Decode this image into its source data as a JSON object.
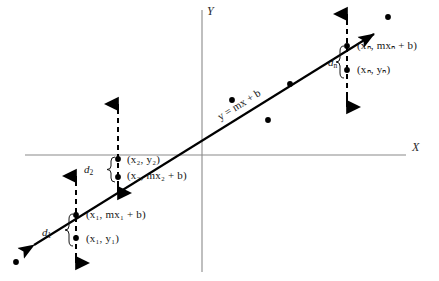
{
  "figure": {
    "axes": {
      "x_label": "X",
      "y_label": "Y",
      "x_axis_y": 155,
      "y_axis_x": 202,
      "color": "#8a8a8a"
    },
    "line": {
      "equation_label": "y = mx + b",
      "color": "#000000",
      "start": [
        30,
        248
      ],
      "end": [
        378,
        31
      ]
    },
    "deviations": [
      {
        "name": "d1",
        "label": "d",
        "subscript": "1",
        "x": 76,
        "line_point_y": 215,
        "data_point_y": 238,
        "arrow_top_y": 175,
        "arrow_bottom_y": 263,
        "labels": [
          {
            "text": "(x₁, mx₁ + b)",
            "plain": "(x1, mx1 + b)",
            "position": "above"
          },
          {
            "text": "(x₁, y₁)",
            "plain": "(x1, y1)",
            "position": "below"
          }
        ]
      },
      {
        "name": "d2",
        "label": "d",
        "subscript": "2",
        "x": 118,
        "line_point_y": 177,
        "data_point_y": 159,
        "arrow_top_y": 103,
        "arrow_bottom_y": 192,
        "labels": [
          {
            "text": "(x₂, y₂)",
            "plain": "(x2, y2)",
            "position": "above"
          },
          {
            "text": "(x₂, mx₂ + b)",
            "plain": "(x2, mx2 + b)",
            "position": "below"
          }
        ]
      },
      {
        "name": "dn",
        "label": "d",
        "subscript": "n",
        "x": 347,
        "line_point_y": 46,
        "data_point_y": 70,
        "arrow_top_y": 14,
        "arrow_bottom_y": 106,
        "labels": [
          {
            "text": "(xₙ, mxₙ + b)",
            "plain": "(xn, mxn + b)",
            "position": "above"
          },
          {
            "text": "(xₙ, yₙ)",
            "plain": "(xn, yn)",
            "position": "below"
          }
        ]
      }
    ],
    "scatter_points": [
      {
        "x": 16,
        "y": 262
      },
      {
        "x": 76,
        "y": 238
      },
      {
        "x": 118,
        "y": 159
      },
      {
        "x": 232,
        "y": 100
      },
      {
        "x": 268,
        "y": 120
      },
      {
        "x": 290,
        "y": 84
      },
      {
        "x": 347,
        "y": 70
      },
      {
        "x": 388,
        "y": 17
      }
    ],
    "line_points": [
      {
        "x": 76,
        "y": 215
      },
      {
        "x": 118,
        "y": 177
      },
      {
        "x": 347,
        "y": 46
      }
    ]
  },
  "labels": {
    "d1_text": "d",
    "d1_sub": "1",
    "d2_text": "d",
    "d2_sub": "2",
    "dn_text": "d",
    "dn_sub": "n",
    "x1_line": "(x₁, mx₁ + b)",
    "x1_data": "(x₁, y₁)",
    "x2_data": "(x₂, y₂)",
    "x2_line": "(x₂, mx₂ + b)",
    "xn_line": "(xₙ, mxₙ + b)",
    "xn_data": "(xₙ, yₙ)",
    "equation": "y = mx + b",
    "axis_x": "X",
    "axis_y": "Y"
  }
}
